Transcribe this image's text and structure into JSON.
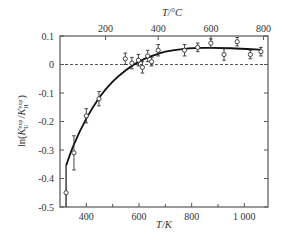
{
  "chart_data": {
    "type": "scatter",
    "title": "",
    "xlabel": "T/K",
    "x2label": "T/°C",
    "ylabel": "ln(K_U^exp/K_H^exp)",
    "xlim": [
      300,
      1090
    ],
    "ylim": [
      -0.5,
      0.1
    ],
    "xticks": [
      400,
      600,
      800,
      1000
    ],
    "xtick_labels": [
      "400",
      "600",
      "800",
      "1 000"
    ],
    "xminor": [
      500,
      700,
      900
    ],
    "x2ticks_celsius": [
      200,
      400,
      600,
      800
    ],
    "x2tick_labels": [
      "200",
      "400",
      "600",
      "800"
    ],
    "yticks": [
      0.1,
      0,
      -0.1,
      -0.2,
      -0.3,
      -0.4,
      -0.5
    ],
    "ytick_labels": [
      "0.1",
      "0",
      "-0.1",
      "-0.2",
      "-0.3",
      "-0.4",
      "-0.5"
    ],
    "reference_line": {
      "y": 0,
      "style": "dashed"
    },
    "series": [
      {
        "name": "experimental",
        "marker": "open-circle",
        "points": [
          {
            "x": 323,
            "y": -0.45,
            "err": 0.0
          },
          {
            "x": 353,
            "y": -0.31,
            "err": 0.06
          },
          {
            "x": 400,
            "y": -0.18,
            "err": 0.025
          },
          {
            "x": 448,
            "y": -0.12,
            "err": 0.025
          },
          {
            "x": 548,
            "y": 0.02,
            "err": 0.02
          },
          {
            "x": 573,
            "y": 0.005,
            "err": 0.02
          },
          {
            "x": 598,
            "y": 0.015,
            "err": 0.02
          },
          {
            "x": 613,
            "y": -0.01,
            "err": 0.02
          },
          {
            "x": 633,
            "y": 0.03,
            "err": 0.02
          },
          {
            "x": 648,
            "y": 0.01,
            "err": 0.015
          },
          {
            "x": 673,
            "y": 0.05,
            "err": 0.02
          },
          {
            "x": 773,
            "y": 0.05,
            "err": 0.02
          },
          {
            "x": 823,
            "y": 0.06,
            "err": 0.015
          },
          {
            "x": 873,
            "y": 0.075,
            "err": 0.015
          },
          {
            "x": 923,
            "y": 0.035,
            "err": 0.02
          },
          {
            "x": 973,
            "y": 0.08,
            "err": 0.015
          },
          {
            "x": 1023,
            "y": 0.035,
            "err": 0.015
          },
          {
            "x": 1063,
            "y": 0.045,
            "err": 0.015
          }
        ]
      },
      {
        "name": "fit",
        "style": "solid-line",
        "points": [
          {
            "x": 323,
            "y": -0.355
          },
          {
            "x": 353,
            "y": -0.28
          },
          {
            "x": 400,
            "y": -0.19
          },
          {
            "x": 450,
            "y": -0.115
          },
          {
            "x": 500,
            "y": -0.06
          },
          {
            "x": 550,
            "y": -0.02
          },
          {
            "x": 600,
            "y": 0.01
          },
          {
            "x": 650,
            "y": 0.03
          },
          {
            "x": 700,
            "y": 0.045
          },
          {
            "x": 773,
            "y": 0.055
          },
          {
            "x": 850,
            "y": 0.058
          },
          {
            "x": 950,
            "y": 0.057
          },
          {
            "x": 1063,
            "y": 0.052
          }
        ]
      }
    ],
    "grid": false,
    "legend": null
  },
  "layout": {
    "plot": {
      "left": 60,
      "right": 268,
      "top": 36,
      "bottom": 207
    },
    "colors": {
      "axis": "#555555",
      "data": "#333333",
      "fit": "#111111",
      "text": "#333333"
    }
  }
}
